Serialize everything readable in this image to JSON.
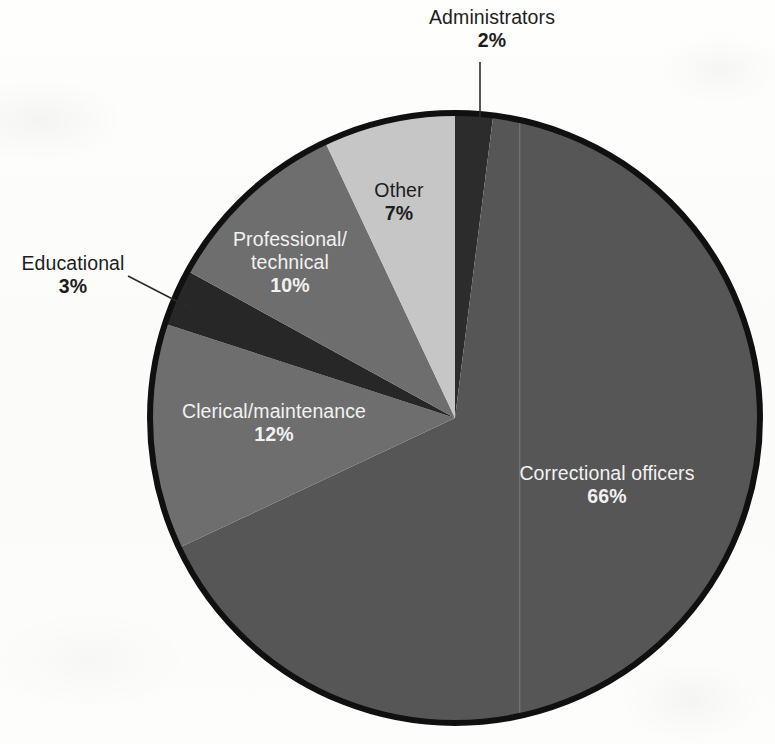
{
  "chart_data": {
    "type": "pie",
    "title": "",
    "subtitle": "",
    "xlabel": "",
    "ylabel": "",
    "legend_position": "none",
    "grid": false,
    "units": "percent",
    "start_angle_deg": 0,
    "direction": "clockwise",
    "categories": [
      "Administrators",
      "Correctional officers",
      "Clerical/maintenance",
      "Educational",
      "Professional/technical",
      "Other"
    ],
    "values": [
      2,
      66,
      12,
      3,
      10,
      7
    ],
    "value_labels": [
      "2%",
      "66%",
      "12%",
      "3%",
      "10%",
      "7%"
    ],
    "slice_colors": [
      "#2c2c2c",
      "#565656",
      "#6e6e6e",
      "#272727",
      "#6e6e6e",
      "#c6c6c6"
    ],
    "outline_color": "#111111",
    "background_color": "#fdfdfc"
  },
  "slices": [
    {
      "key": "administrators",
      "name": "Administrators",
      "pct": "2%",
      "value": 2,
      "color": "#2c2c2c",
      "label_placement": "outside-callout",
      "label_color": "#1d1d1d"
    },
    {
      "key": "correctional-officers",
      "name": "Correctional officers",
      "pct": "66%",
      "value": 66,
      "color": "#565656",
      "label_placement": "inside",
      "label_color": "#f2f2f2"
    },
    {
      "key": "clerical-maintenance",
      "name": "Clerical/maintenance",
      "pct": "12%",
      "value": 12,
      "color": "#6e6e6e",
      "label_placement": "inside",
      "label_color": "#f2f2f2"
    },
    {
      "key": "educational",
      "name": "Educational",
      "pct": "3%",
      "value": 3,
      "color": "#272727",
      "label_placement": "outside-callout",
      "label_color": "#1d1d1d"
    },
    {
      "key": "professional-technical",
      "name_line1": "Professional/",
      "name_line2": "technical",
      "name": "Professional/technical",
      "pct": "10%",
      "value": 10,
      "color": "#6e6e6e",
      "label_placement": "inside",
      "label_color": "#f2f2f2"
    },
    {
      "key": "other",
      "name": "Other",
      "pct": "7%",
      "value": 7,
      "color": "#c6c6c6",
      "label_placement": "inside",
      "label_color": "#1d1d1d"
    }
  ]
}
